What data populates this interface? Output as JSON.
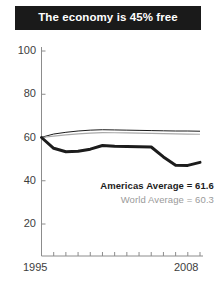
{
  "title": "The economy is 45% free",
  "legend": {
    "americas": "Americas Average = 61.6",
    "world": "World Average = 60.3"
  },
  "axis": {
    "y_ticks": [
      "100",
      "80",
      "60",
      "40",
      "20"
    ],
    "x_start": "1995",
    "x_end": "2008"
  },
  "colors": {
    "banner_bg": "#1a1a1a",
    "banner_text": "#ffffff",
    "americas_line": "#1c1c1c",
    "world_line": "#aaaaaa",
    "axis": "#8c8c8c",
    "tick_text": "#3d3d3d"
  },
  "chart_data": {
    "type": "line",
    "title": "The economy is 45% free",
    "xlabel": "",
    "ylabel": "",
    "xlim": [
      1995,
      2008
    ],
    "ylim": [
      0,
      100
    ],
    "yticks": [
      20,
      40,
      60,
      80,
      100
    ],
    "xticks": [
      1995,
      1996,
      1997,
      1998,
      1999,
      2000,
      2001,
      2002,
      2003,
      2004,
      2005,
      2006,
      2007,
      2008
    ],
    "grid": false,
    "legend_position": "inside-lower-right",
    "x": [
      1995,
      1996,
      1997,
      1998,
      1999,
      2000,
      2001,
      2002,
      2003,
      2004,
      2005,
      2006,
      2007,
      2008
    ],
    "series": [
      {
        "name": "Americas Average",
        "color": "#1c1c1c",
        "label": "Americas Average = 61.6",
        "values": [
          60.0,
          55.0,
          53.4,
          53.6,
          54.6,
          56.3,
          55.9,
          55.8,
          55.7,
          55.6,
          51.0,
          47.2,
          47.1,
          48.5
        ]
      },
      {
        "name": "World Average",
        "color": "#aaaaaa",
        "label": "World Average = 60.3",
        "values": [
          60.0,
          60.6,
          61.2,
          61.7,
          62.0,
          62.3,
          62.2,
          62.1,
          62.0,
          61.9,
          61.8,
          61.7,
          61.6,
          61.5
        ]
      },
      {
        "name": "Upper Envelope",
        "color": "#1c1c1c",
        "label": "",
        "values": [
          60.1,
          61.6,
          62.4,
          63.0,
          63.4,
          63.6,
          63.5,
          63.4,
          63.3,
          63.2,
          63.1,
          63.0,
          63.0,
          62.9
        ]
      }
    ]
  }
}
